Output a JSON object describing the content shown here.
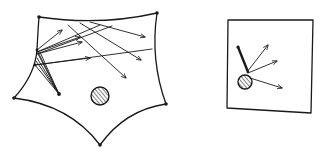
{
  "figure": {
    "colors": {
      "ink": "#1a1a1a",
      "background": "#ffffff"
    },
    "left_panel": {
      "vertices": [
        [
          39,
          17
        ],
        [
          157,
          13
        ],
        [
          166,
          104
        ],
        [
          100,
          145
        ],
        [
          14,
          98
        ]
      ],
      "source_points": [
        [
          37,
          50
        ],
        [
          35,
          65
        ]
      ],
      "inner_point": [
        59,
        94
      ],
      "obstacle": {
        "cx": 100,
        "cy": 96,
        "r": 9,
        "fill": "hatched"
      },
      "rays": [
        {
          "from": [
            37,
            50
          ],
          "to": [
            62,
            30
          ]
        },
        {
          "from": [
            37,
            52
          ],
          "to": [
            80,
            37
          ]
        },
        {
          "from": [
            37,
            54
          ],
          "to": [
            82,
            42
          ]
        },
        {
          "from": [
            35,
            65
          ],
          "to": [
            150,
            50
          ]
        },
        {
          "from": [
            68,
            25
          ],
          "to": [
            145,
            37
          ]
        },
        {
          "from": [
            72,
            26
          ],
          "to": [
            137,
            60
          ]
        },
        {
          "from": [
            65,
            30
          ],
          "to": [
            125,
            78
          ]
        }
      ]
    },
    "right_panel": {
      "box": [
        [
          228,
          20
        ],
        [
          313,
          20
        ],
        [
          311,
          113
        ],
        [
          227,
          108
        ]
      ],
      "obstacle": {
        "cx": 245,
        "cy": 82,
        "r": 7,
        "fill": "hatched"
      },
      "stick": {
        "from": [
          238,
          47
        ],
        "to": [
          248,
          72
        ]
      },
      "arrows": [
        {
          "from": [
            248,
            72
          ],
          "to": [
            268,
            45
          ]
        },
        {
          "from": [
            248,
            73
          ],
          "to": [
            277,
            61
          ]
        },
        {
          "from": [
            250,
            78
          ],
          "to": [
            282,
            88
          ]
        }
      ]
    }
  }
}
